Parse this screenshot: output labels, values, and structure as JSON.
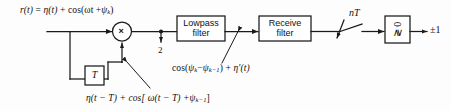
{
  "diagram": {
    "stroke_color": "#1a1a1a",
    "text_color": "#111111",
    "background": "#fdfdfd",
    "input_signal_label": "r(t) = η(t) + cos(ωt + ψ",
    "input_signal": {
      "lhs": "r(t)",
      "eq": "=",
      "noise": "η(t)",
      "plus": "+",
      "carrier": "cos(ωt +",
      "phase_sym": "ψ",
      "phase_idx": "k",
      "close": ")"
    },
    "multiplier": {
      "symbol": "×",
      "name": "multiplier"
    },
    "gain_label": "2",
    "blocks": [
      {
        "id": "lowpass",
        "line1": "Lowpass",
        "line2": "filter"
      },
      {
        "id": "receive",
        "line1": "Receive",
        "line2": "filter"
      }
    ],
    "delay_block": {
      "label": "T"
    },
    "sampler": {
      "label": "nT"
    },
    "threshold": {
      "compare": "≷",
      "level": "0"
    },
    "output_label": "±1",
    "annotations": {
      "lowpass_output": {
        "cos": "cos(",
        "psi_a": "ψ",
        "idx_a": "k",
        "minus": "−",
        "psi_b": "ψ",
        "idx_b": "k−1",
        "close": ") +",
        "noise": "η′(t)"
      },
      "delay_output": {
        "noise": "η(t − T) + cos[",
        "carrier": "ω(t − T) +",
        "psi": "ψ",
        "idx": "k−1",
        "close": "]"
      }
    }
  }
}
